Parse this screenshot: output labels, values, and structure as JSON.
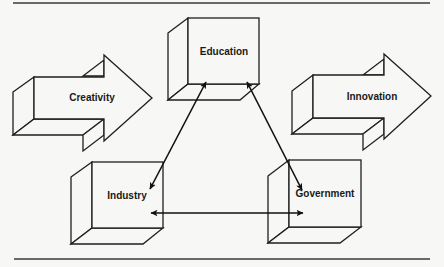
{
  "diagram": {
    "nodes": {
      "education": {
        "label": "Education",
        "shape": "box"
      },
      "industry": {
        "label": "Industry",
        "shape": "box"
      },
      "government": {
        "label": "Government",
        "shape": "box"
      },
      "creativity": {
        "label": "Creativity",
        "shape": "block-arrow"
      },
      "innovation": {
        "label": "Innovation",
        "shape": "block-arrow"
      }
    },
    "edges": [
      {
        "from": "education",
        "to": "industry",
        "direction": "bidirectional"
      },
      {
        "from": "education",
        "to": "government",
        "direction": "bidirectional"
      },
      {
        "from": "industry",
        "to": "government",
        "direction": "bidirectional"
      }
    ],
    "colors": {
      "stroke": "#1f1f1f",
      "background": "#f7f7f5"
    }
  }
}
